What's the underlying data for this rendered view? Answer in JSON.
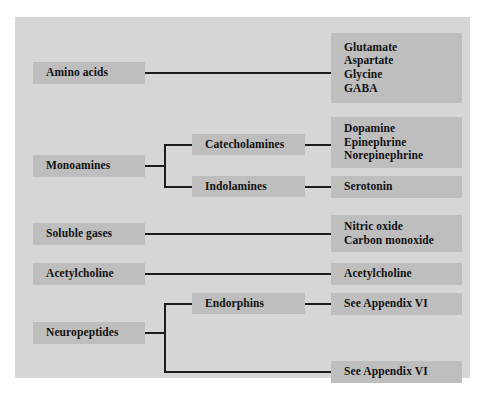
{
  "figure": {
    "panel_color": "#d6d6d6",
    "box_color": "#bebebe",
    "line_color": "#1c1c1c",
    "page_background": "#ffffff"
  },
  "categories": [
    {
      "id": "amino-acids",
      "label": "Amino acids",
      "subtypes": [],
      "examples": [
        "Glutamate",
        "Aspartate",
        "Glycine",
        "GABA"
      ]
    },
    {
      "id": "monoamines",
      "label": "Monoamines",
      "subtypes": [
        {
          "id": "catecholamines",
          "label": "Catecholamines",
          "examples": [
            "Dopamine",
            "Epinephrine",
            "Norepinephrine"
          ]
        },
        {
          "id": "indolamines",
          "label": "Indolamines",
          "examples": [
            "Serotonin"
          ]
        }
      ],
      "examples": []
    },
    {
      "id": "soluble-gases",
      "label": "Soluble gases",
      "subtypes": [],
      "examples": [
        "Nitric oxide",
        "Carbon monoxide"
      ]
    },
    {
      "id": "acetylcholine",
      "label": "Acetylcholine",
      "subtypes": [],
      "examples": [
        "Acetylcholine"
      ]
    },
    {
      "id": "neuropeptides",
      "label": "Neuropeptides",
      "subtypes": [
        {
          "id": "endorphins",
          "label": "Endorphins",
          "examples": [
            "See Appendix VI"
          ]
        }
      ],
      "examples": [
        "See Appendix VI"
      ]
    }
  ],
  "boxes": {
    "amino_acids": "Amino acids",
    "monoamines": "Monoamines",
    "soluble_gases": "Soluble gases",
    "acetylcholine_left": "Acetylcholine",
    "neuropeptides": "Neuropeptides",
    "catecholamines": "Catecholamines",
    "indolamines": "Indolamines",
    "endorphins": "Endorphins",
    "amino_acid_list": {
      "l1": "Glutamate",
      "l2": "Aspartate",
      "l3": "Glycine",
      "l4": "GABA"
    },
    "catecholamine_list": {
      "l1": "Dopamine",
      "l2": "Epinephrine",
      "l3": "Norepinephrine"
    },
    "indolamine_list": {
      "l1": "Serotonin"
    },
    "gas_list": {
      "l1": "Nitric oxide",
      "l2": "Carbon monoxide"
    },
    "acetylcholine_right": {
      "l1": "Acetylcholine"
    },
    "endorphin_list": {
      "l1": "See Appendix VI"
    },
    "neuropeptide_list": {
      "l1": "See Appendix VI"
    }
  }
}
